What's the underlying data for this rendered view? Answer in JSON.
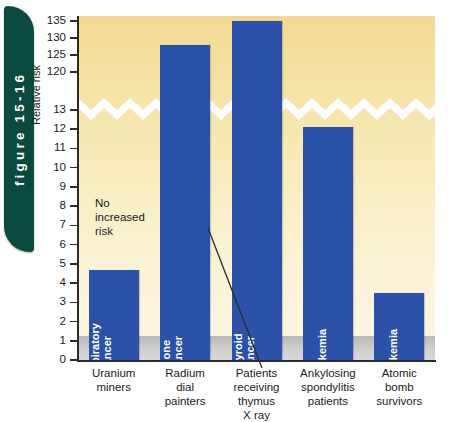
{
  "figure": {
    "tab_label": "figure 15-16"
  },
  "chart_data": {
    "type": "bar",
    "title": "",
    "xlabel": "",
    "ylabel": "Relative risk",
    "categories": [
      "Uranium miners",
      "Radium dial painters",
      "Patients receiving thymus X ray",
      "Ankylosing spondylitis patients",
      "Atomic bomb survivors"
    ],
    "category_lines": [
      [
        "Uranium",
        "miners"
      ],
      [
        "Radium",
        "dial",
        "painters"
      ],
      [
        "Patients",
        "receiving",
        "thymus",
        "X ray"
      ],
      [
        "Ankylosing",
        "spondylitis",
        "patients"
      ],
      [
        "Atomic",
        "bomb",
        "survivors"
      ]
    ],
    "bar_labels": [
      [
        "Respiratory",
        "cancer"
      ],
      [
        "Bone",
        "cancer"
      ],
      [
        "Thyroid",
        "cancer"
      ],
      [
        "Leukemia"
      ],
      [
        "Leukemia"
      ]
    ],
    "values": [
      4.7,
      128,
      135,
      12.1,
      3.5
    ],
    "ytick_labels": [
      "135",
      "130",
      "125",
      "120",
      "13",
      "12",
      "11",
      "10",
      "9",
      "8",
      "7",
      "6",
      "5",
      "4",
      "3",
      "2",
      "1",
      "0"
    ],
    "ytick_values": [
      135,
      130,
      125,
      120,
      13,
      12,
      11,
      10,
      9,
      8,
      7,
      6,
      5,
      4,
      3,
      2,
      1,
      0
    ],
    "axis_break": true,
    "axis_break_between": [
      120,
      13
    ],
    "grid": false,
    "legend": "none",
    "baseline_band": {
      "from": 0,
      "to": 1,
      "meaning": "No increased risk"
    },
    "annotation": {
      "lines": [
        "No",
        "increased",
        "risk"
      ]
    },
    "colors": {
      "bar": "#2b52a8",
      "plot_background_top": "#f3da93",
      "plot_background_bottom": "#fdf8e6",
      "baseline_band": "#c6c6c6",
      "axis": "#2b2b2b",
      "tab": "#0b4a3f",
      "break_marker": "#ffffff"
    }
  }
}
